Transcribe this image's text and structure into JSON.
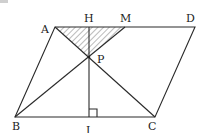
{
  "diagram": {
    "type": "geometry",
    "shape": "parallelogram ABCD",
    "points": {
      "A": {
        "label": "A",
        "x": 55,
        "y": 27
      },
      "H": {
        "label": "H",
        "x": 89,
        "y": 27
      },
      "M": {
        "label": "M",
        "x": 125,
        "y": 27
      },
      "D": {
        "label": "D",
        "x": 195,
        "y": 27
      },
      "P": {
        "label": "P",
        "x": 89,
        "y": 57
      },
      "B": {
        "label": "B",
        "x": 15,
        "y": 117
      },
      "I": {
        "label": "I",
        "x": 89,
        "y": 117
      },
      "C": {
        "label": "C",
        "x": 155,
        "y": 117
      }
    },
    "segments": [
      "AD",
      "DC",
      "CB",
      "BA",
      "AC",
      "BM",
      "HI"
    ],
    "shaded_region": "triangle AMP (hatched)",
    "right_angle_at": "I"
  }
}
